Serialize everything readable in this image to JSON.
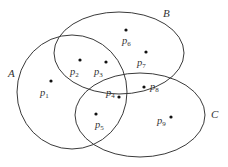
{
  "diagram": {
    "type": "venn",
    "sets": [
      {
        "name": "A",
        "label": "A",
        "cx": 72,
        "cy": 92,
        "rx": 55,
        "ry": 57,
        "label_x": 8,
        "label_y": 77
      },
      {
        "name": "B",
        "label": "B",
        "cx": 119,
        "cy": 53,
        "rx": 65,
        "ry": 41,
        "label_x": 163,
        "label_y": 17
      },
      {
        "name": "C",
        "label": "C",
        "cx": 140,
        "cy": 115,
        "rx": 65,
        "ry": 42,
        "label_x": 211,
        "label_y": 118
      }
    ],
    "points": [
      {
        "id": "p1",
        "base": "p",
        "sub": "1",
        "x": 51,
        "y": 81,
        "lx": 40,
        "ly": 96,
        "regions": [
          "A"
        ]
      },
      {
        "id": "p2",
        "base": "p",
        "sub": "2",
        "x": 80,
        "y": 60,
        "lx": 70,
        "ly": 75,
        "regions": [
          "A",
          "B"
        ]
      },
      {
        "id": "p3",
        "base": "p",
        "sub": "3",
        "x": 106,
        "y": 62,
        "lx": 94,
        "ly": 75,
        "regions": [
          "A",
          "B"
        ]
      },
      {
        "id": "p4",
        "base": "p",
        "sub": "4",
        "x": 119,
        "y": 97,
        "lx": 106,
        "ly": 96,
        "regions": [
          "A",
          "B",
          "C"
        ]
      },
      {
        "id": "p5",
        "base": "p",
        "sub": "5",
        "x": 96,
        "y": 114,
        "lx": 95,
        "ly": 128,
        "regions": [
          "A",
          "C"
        ]
      },
      {
        "id": "p6",
        "base": "p",
        "sub": "6",
        "x": 126,
        "y": 30,
        "lx": 122,
        "ly": 44,
        "regions": [
          "B"
        ]
      },
      {
        "id": "p7",
        "base": "p",
        "sub": "7",
        "x": 146,
        "y": 52,
        "lx": 137,
        "ly": 66,
        "regions": [
          "B"
        ]
      },
      {
        "id": "p8",
        "base": "p",
        "sub": "8",
        "x": 144,
        "y": 87,
        "lx": 150,
        "ly": 90,
        "regions": [
          "B",
          "C"
        ]
      },
      {
        "id": "p9",
        "base": "p",
        "sub": "9",
        "x": 171,
        "y": 117,
        "lx": 157,
        "ly": 124,
        "regions": [
          "C"
        ]
      }
    ]
  }
}
